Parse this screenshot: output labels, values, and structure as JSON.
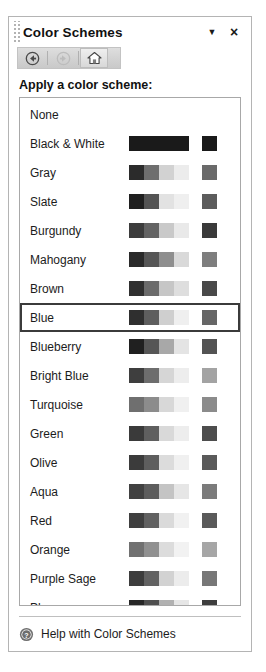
{
  "panel": {
    "title": "Color Schemes",
    "grip_icon": "drag-grip-icon",
    "dropdown_label": "▼",
    "close_label": "×"
  },
  "toolbar": {
    "back": {
      "icon": "back-arrow-icon",
      "label": "Back",
      "enabled": true
    },
    "forward": {
      "icon": "forward-arrow-icon",
      "label": "Forward",
      "enabled": false
    },
    "home": {
      "icon": "home-icon",
      "label": "Home",
      "enabled": true
    }
  },
  "section": {
    "heading": "Apply a color scheme:"
  },
  "schemes": [
    {
      "name": "None",
      "strip": [],
      "single": ""
    },
    {
      "name": "Black & White",
      "strip": [
        "#1a1a1a",
        "#1a1a1a",
        "#1a1a1a",
        "#1a1a1a"
      ],
      "single": "#1a1a1a"
    },
    {
      "name": "Gray",
      "strip": [
        "#2b2b2b",
        "#6e6e6e",
        "#d2d2d2",
        "#ececec"
      ],
      "single": "#6a6a6a"
    },
    {
      "name": "Slate",
      "strip": [
        "#1f1f1f",
        "#545454",
        "#e2e2e2",
        "#efefef"
      ],
      "single": "#5c5c5c"
    },
    {
      "name": "Burgundy",
      "strip": [
        "#3c3c3c",
        "#636363",
        "#c9c9c9",
        "#e9e9e9"
      ],
      "single": "#3a3a3a"
    },
    {
      "name": "Mahogany",
      "strip": [
        "#2a2a2a",
        "#565656",
        "#8e8e8e",
        "#d9d9d9"
      ],
      "single": "#7e7e7e"
    },
    {
      "name": "Brown",
      "strip": [
        "#303030",
        "#6b6b6b",
        "#c6c6c6",
        "#dedede"
      ],
      "single": "#494949"
    },
    {
      "name": "Blue",
      "strip": [
        "#2f2f2f",
        "#5e5e5e",
        "#cfcfcf",
        "#efefef"
      ],
      "single": "#666666"
    },
    {
      "name": "Blueberry",
      "strip": [
        "#202020",
        "#565656",
        "#a8a8a8",
        "#e4e4e4"
      ],
      "single": "#535353"
    },
    {
      "name": "Bright Blue",
      "strip": [
        "#3e3e3e",
        "#6d6d6d",
        "#d6d6d6",
        "#ededed"
      ],
      "single": "#a3a3a3"
    },
    {
      "name": "Turquoise",
      "strip": [
        "#6f6f6f",
        "#8c8c8c",
        "#d8d8d8",
        "#f0f0f0"
      ],
      "single": "#8b8b8b"
    },
    {
      "name": "Green",
      "strip": [
        "#3a3a3a",
        "#5f5f5f",
        "#d9d9d9",
        "#ededed"
      ],
      "single": "#4d4d4d"
    },
    {
      "name": "Olive",
      "strip": [
        "#3b3b3b",
        "#5e5e5e",
        "#dcdcdc",
        "#f0f0f0"
      ],
      "single": "#5a5a5a"
    },
    {
      "name": "Aqua",
      "strip": [
        "#414141",
        "#5d5d5d",
        "#c4c4c4",
        "#e6e6e6"
      ],
      "single": "#7b7b7b"
    },
    {
      "name": "Red",
      "strip": [
        "#3f3f3f",
        "#616161",
        "#dadada",
        "#f1f1f1"
      ],
      "single": "#5a5a5a"
    },
    {
      "name": "Orange",
      "strip": [
        "#717171",
        "#909090",
        "#dcdcdc",
        "#f2f2f2"
      ],
      "single": "#a6a6a6"
    },
    {
      "name": "Purple Sage",
      "strip": [
        "#3d3d3d",
        "#626262",
        "#d2d2d2",
        "#ececec"
      ],
      "single": "#777777"
    },
    {
      "name": "Plum",
      "strip": [
        "#272727",
        "#4f4f4f",
        "#b1b1b1",
        "#e6e6e6"
      ],
      "single": "#3d3d3d"
    }
  ],
  "selected_scheme": "Blue",
  "footer": {
    "help_icon": "help-question-icon",
    "help_label": "Help with Color Schemes"
  },
  "colors": {
    "panel_border": "#b4b4b4",
    "list_border": "#a8a8a8",
    "selection_border": "#3b3b3b",
    "text": "#1c1c1c",
    "toolbar_bg": "#d4d4d4"
  }
}
